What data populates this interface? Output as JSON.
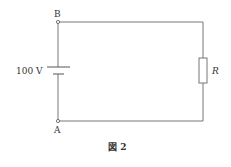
{
  "diagram": {
    "type": "circuit",
    "nodes": {
      "top_left": "B",
      "bottom_left": "A"
    },
    "battery": {
      "label": "100 V"
    },
    "resistor": {
      "label": "R"
    },
    "caption": "図 2"
  }
}
